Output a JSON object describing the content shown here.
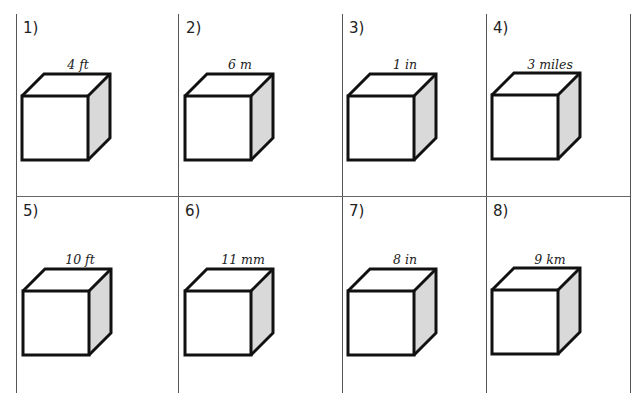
{
  "worksheet": {
    "problems": [
      {
        "number": "1)",
        "dimension": "4 ft"
      },
      {
        "number": "2)",
        "dimension": "6 m"
      },
      {
        "number": "3)",
        "dimension": "1 in"
      },
      {
        "number": "4)",
        "dimension": "3 miles"
      },
      {
        "number": "5)",
        "dimension": "10 ft"
      },
      {
        "number": "6)",
        "dimension": "11 mm"
      },
      {
        "number": "7)",
        "dimension": "8 in"
      },
      {
        "number": "8)",
        "dimension": "9 km"
      }
    ],
    "figure": "cube",
    "colors": {
      "stroke": "#111111",
      "side_face": "#d9d9d9",
      "grid_line": "#555555"
    }
  }
}
